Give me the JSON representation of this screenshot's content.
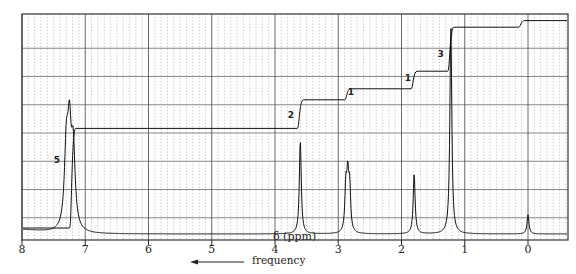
{
  "chart_data": {
    "type": "line",
    "xlabel": "δ (ppm)",
    "ylabel": "",
    "xlim": [
      8,
      -0.5
    ],
    "x_ticks": [
      8,
      7,
      6,
      5,
      4,
      3,
      2,
      1,
      0
    ],
    "x_tick_labels": [
      "8",
      "7",
      "6",
      "5",
      "4",
      "3",
      "2",
      "1",
      "0"
    ],
    "grid": true,
    "direction_annotation": "frequency",
    "peaks": [
      {
        "shift": 7.25,
        "label": "aromatic multiplet",
        "relative_height": 0.42,
        "integration": 5
      },
      {
        "shift": 3.6,
        "label": "singlet",
        "relative_height": 0.44,
        "integration": 2
      },
      {
        "shift": 2.85,
        "label": "multiplet",
        "relative_height": 0.24,
        "integration": 1
      },
      {
        "shift": 1.8,
        "label": "singlet",
        "relative_height": 0.28,
        "integration": 1
      },
      {
        "shift": 1.22,
        "label": "doublet",
        "relative_height": 0.98,
        "integration": 3
      },
      {
        "shift": 0.0,
        "label": "TMS",
        "relative_height": 0.09,
        "integration": null
      }
    ],
    "integration_labels": [
      {
        "text": "5",
        "shift": 7.45
      },
      {
        "text": "2",
        "shift": 3.75
      },
      {
        "text": "1",
        "shift": 2.8
      },
      {
        "text": "1",
        "shift": 1.9
      },
      {
        "text": "3",
        "shift": 1.38
      }
    ],
    "integration_curve": {
      "steps": [
        {
          "shift": 7.2,
          "level": 0.48
        },
        {
          "shift": 3.6,
          "level": 0.61
        },
        {
          "shift": 2.85,
          "level": 0.66
        },
        {
          "shift": 1.8,
          "level": 0.74
        },
        {
          "shift": 1.22,
          "level": 0.94
        },
        {
          "shift": 0.1,
          "level": 0.97
        }
      ]
    }
  },
  "axis": {
    "ticks": [
      "8",
      "7",
      "6",
      "5",
      "4",
      "3",
      "2",
      "1",
      "0"
    ],
    "xlabel": "δ (ppm)",
    "arrow_label": "frequency"
  },
  "integration_labels": [
    "5",
    "2",
    "1",
    "1",
    "3"
  ]
}
